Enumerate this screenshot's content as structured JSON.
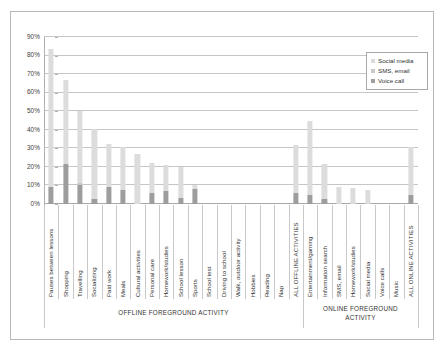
{
  "chart_data": {
    "type": "bar",
    "subtype": "stacked-bar",
    "title": "",
    "subtitle": "",
    "xlabel": "",
    "ylabel": "",
    "ylim": [
      0,
      90
    ],
    "ytick_labels": [
      "0%",
      "10%",
      "20%",
      "30%",
      "40%",
      "50%",
      "60%",
      "70%",
      "80%",
      "90%"
    ],
    "ytick_values": [
      0,
      10,
      20,
      30,
      40,
      50,
      60,
      70,
      80,
      90
    ],
    "grid": true,
    "legend_position": "top-right",
    "legend": [
      "Social media",
      "SMS, email",
      "Voice call"
    ],
    "series": [
      {
        "name": "Voice call",
        "color": "#9d9d9d",
        "values": [
          9.0,
          21.5,
          10.0,
          2.5,
          9.0,
          7.5,
          0.0,
          6.0,
          7.0,
          3.0,
          8.0,
          0.0,
          0.0,
          0.0,
          0.0,
          0.0,
          0.0,
          6.0,
          5.0,
          2.5,
          0.0,
          0.0,
          0.0,
          0.0,
          0.0,
          5.0
        ]
      },
      {
        "name": "SMS, email",
        "color": "#c9c9c9",
        "values": [
          0.0,
          0.0,
          1.5,
          0.0,
          0.0,
          0.0,
          0.0,
          0.0,
          0.0,
          0.0,
          0.0,
          0.0,
          0.0,
          0.0,
          0.0,
          0.0,
          0.0,
          0.0,
          0.0,
          0.0,
          0.0,
          0.0,
          0.0,
          0.0,
          0.0,
          0.0
        ]
      },
      {
        "name": "Social media",
        "color": "#dcdcdc",
        "values": [
          74.5,
          45.5,
          38.5,
          38.0,
          23.5,
          23.5,
          27.0,
          16.0,
          14.0,
          17.0,
          2.0,
          0.0,
          0.0,
          0.0,
          0.0,
          0.0,
          0.0,
          26.0,
          39.5,
          19.0,
          9.0,
          8.5,
          7.5,
          0.0,
          0.0,
          26.0
        ]
      }
    ],
    "totals": [
      83.5,
      67.0,
      50.0,
      40.5,
      32.5,
      31.0,
      27.0,
      22.0,
      21.0,
      20.0,
      10.0,
      0.0,
      0.0,
      0.0,
      0.0,
      0.0,
      0.0,
      32.0,
      44.5,
      21.5,
      9.0,
      8.5,
      7.5,
      0.0,
      0.0,
      31.0
    ],
    "categories": [
      "Pauses between lessons",
      "Shopping",
      "Travelling",
      "Socializing",
      "Paid work",
      "Meals",
      "Cultural activities",
      "Personal care",
      "Homework/studies",
      "School lesson",
      "Sports",
      "School test",
      "Driving to school",
      "Walk, outdoor activity",
      "Hobbies",
      "Reading",
      "Nap",
      "ALL OFFLINE ACTIVITIES",
      "Entertainment/gaming",
      "Information search",
      "SMS, email",
      "Homework/studies",
      "Social media",
      "Voice calls",
      "Music",
      "ALL ONLINE ACTIVITIES"
    ],
    "groups": [
      {
        "label": "OFFLINE FOREGROUND ACTIVITY",
        "from": 0,
        "to": 17
      },
      {
        "label": "ONLINE FOREGROUND\nACTIVITY",
        "from": 18,
        "to": 25
      }
    ]
  },
  "colors": {
    "social_media": "#dcdcdc",
    "sms_email": "#c9c9c9",
    "voice_call": "#9d9d9d",
    "gridline": "#c6c6c6",
    "frame": "#b9b9b9",
    "text": "#333333"
  }
}
